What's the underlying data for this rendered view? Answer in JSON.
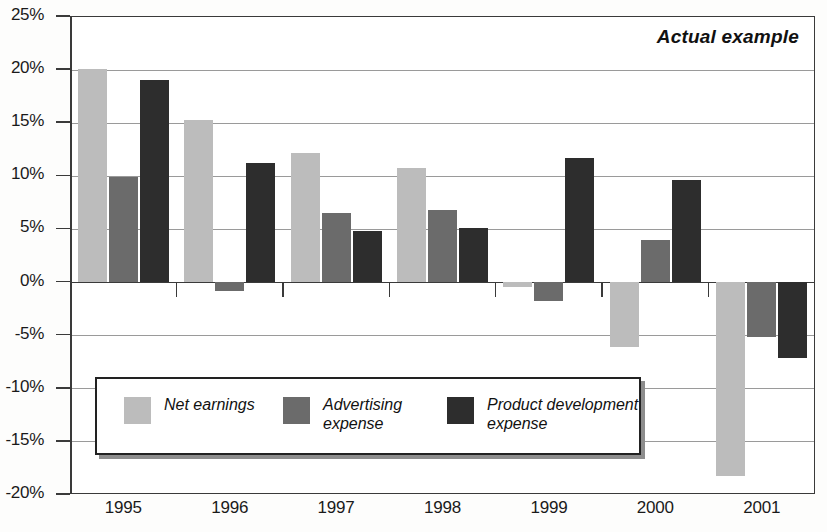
{
  "chart_data": {
    "type": "bar",
    "title": "Actual example",
    "xlabel": "",
    "ylabel": "",
    "ylim": [
      -20,
      25
    ],
    "ytick_labels": [
      "25%",
      "20%",
      "15%",
      "10%",
      "5%",
      "0%",
      "-5%",
      "-10%",
      "-15%",
      "-20%"
    ],
    "ytick_values": [
      25,
      20,
      15,
      10,
      5,
      0,
      -5,
      -10,
      -15,
      -20
    ],
    "grid": true,
    "legend_position": "lower-left-inside",
    "categories": [
      "1995",
      "1996",
      "1997",
      "1998",
      "1999",
      "2000",
      "2001"
    ],
    "series": [
      {
        "name": "Net earnings",
        "legend_label": "Net earnings",
        "color": "#bcbcbc",
        "values": [
          20.0,
          15.2,
          12.1,
          10.7,
          -0.5,
          -6.2,
          -18.3
        ]
      },
      {
        "name": "Advertising expense",
        "legend_label": "Advertising\nexpense",
        "color": "#6b6b6b",
        "values": [
          9.8,
          -0.9,
          6.5,
          6.7,
          -1.8,
          3.9,
          -5.2
        ]
      },
      {
        "name": "Product development expense",
        "legend_label": "Product development\nexpense",
        "color": "#2d2d2d",
        "values": [
          19.0,
          11.2,
          4.8,
          5.0,
          11.6,
          9.6,
          -7.2
        ]
      }
    ]
  },
  "colors": {
    "series_light": "#bcbcbc",
    "series_medium": "#6b6b6b",
    "series_dark": "#2d2d2d",
    "axis": "#3a3a3a",
    "grid": "#9a9a9a",
    "background": "#ffffff"
  }
}
